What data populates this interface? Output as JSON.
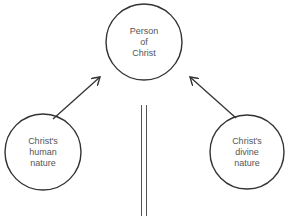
{
  "diagram": {
    "nodes": [
      {
        "id": "person",
        "lines": [
          "Person",
          "of",
          "Christ"
        ]
      },
      {
        "id": "human",
        "lines": [
          "Christ's",
          "human",
          "nature"
        ]
      },
      {
        "id": "divine",
        "lines": [
          "Christ's",
          "divine",
          "nature"
        ]
      }
    ],
    "edges": [
      {
        "from": "human",
        "to": "person",
        "type": "arrow"
      },
      {
        "from": "divine",
        "to": "person",
        "type": "arrow"
      },
      {
        "between": "human/divine",
        "type": "double-line-separator"
      }
    ],
    "colors": {
      "stroke": "#333333",
      "text": "#555555",
      "background": "#ffffff"
    }
  }
}
